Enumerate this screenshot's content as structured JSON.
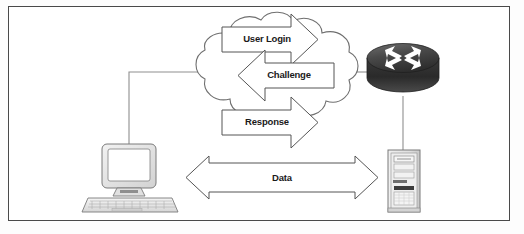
{
  "diagram": {
    "background_color": "#fdfdfd",
    "frame_color": "#4a4a4a",
    "line_color": "#8a8a8a",
    "label_color": "#1a1a1a",
    "flows": [
      {
        "id": "user-login",
        "label": "User Login",
        "direction": "right",
        "from": "workstation",
        "to": "router"
      },
      {
        "id": "challenge",
        "label": "Challenge",
        "direction": "left",
        "from": "router",
        "to": "workstation"
      },
      {
        "id": "response",
        "label": "Response",
        "direction": "right",
        "from": "workstation",
        "to": "router"
      },
      {
        "id": "data",
        "label": "Data",
        "direction": "both",
        "from": "workstation",
        "to": "server"
      }
    ],
    "nodes": [
      {
        "id": "cloud",
        "type": "network-cloud",
        "label": ""
      },
      {
        "id": "router",
        "type": "router",
        "label": "",
        "body_color": "#3b3b3b",
        "arrow_color": "#ffffff"
      },
      {
        "id": "workstation",
        "type": "desktop-computer",
        "label": "",
        "body_color": "#e8e8e8"
      },
      {
        "id": "server",
        "type": "server-tower",
        "label": "",
        "body_color": "#e4e4e4"
      }
    ],
    "links": [
      {
        "from": "workstation",
        "to": "cloud"
      },
      {
        "from": "cloud",
        "to": "router"
      },
      {
        "from": "router",
        "to": "server"
      }
    ]
  }
}
